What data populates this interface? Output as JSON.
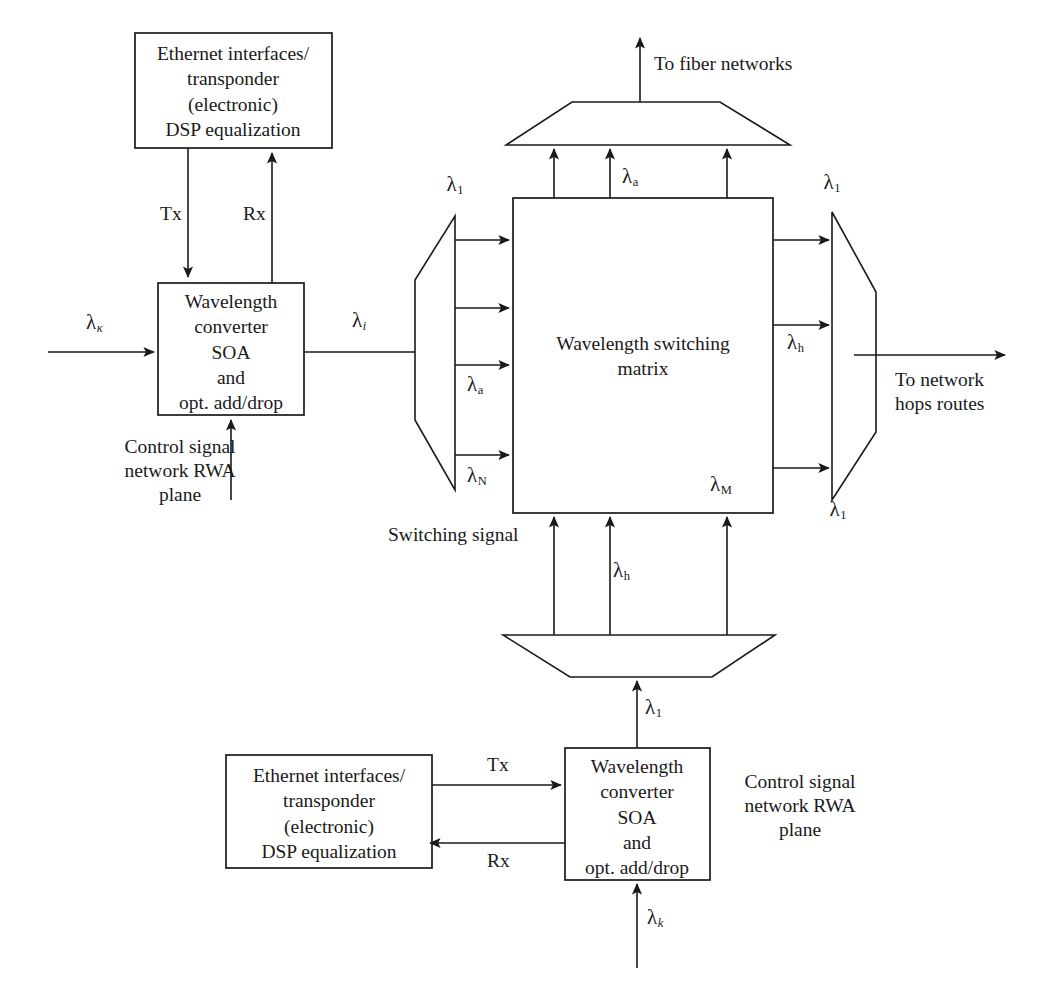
{
  "diagram": {
    "ink_color": "#1a1a1a",
    "background": "#ffffff"
  },
  "blocks": {
    "ethernet_top": {
      "lines": [
        "Ethernet interfaces/",
        "transponder",
        "(electronic)",
        "DSP equalization"
      ]
    },
    "converter_top": {
      "lines": [
        "Wavelength",
        "converter",
        "SOA",
        "and",
        "opt. add/drop"
      ]
    },
    "ethernet_bottom": {
      "lines": [
        "Ethernet interfaces/",
        "transponder",
        "(electronic)",
        "DSP equalization"
      ]
    },
    "converter_bottom": {
      "lines": [
        "Wavelength",
        "converter",
        "SOA",
        "and",
        "opt. add/drop"
      ]
    },
    "matrix": {
      "lines": [
        "Wavelength switching",
        "matrix"
      ]
    }
  },
  "labels": {
    "tx_top": "Tx",
    "rx_top": "Rx",
    "tx_bottom": "Tx",
    "rx_bottom": "Rx",
    "control_left": [
      "Control signal",
      "network RWA",
      "plane"
    ],
    "control_right": [
      "Control signal",
      "network RWA",
      "plane"
    ],
    "to_fiber_networks": "To fiber networks",
    "to_network_hops": [
      "To network",
      "hops routes"
    ],
    "switching_signal": "Switching signal"
  },
  "wavelengths": {
    "input_left": {
      "glyph": "λ",
      "sub": "κ",
      "italic": true
    },
    "converter_out": {
      "glyph": "λ",
      "sub": "i",
      "italic": true
    },
    "demux_top": {
      "glyph": "λ",
      "sub": "1",
      "italic": false
    },
    "demux_mid": {
      "glyph": "λ",
      "sub": "a",
      "italic": false
    },
    "demux_bottom": {
      "glyph": "λ",
      "sub": "N",
      "italic": false
    },
    "matrix_up_mid": {
      "glyph": "λ",
      "sub": "a",
      "italic": false
    },
    "matrix_corner": {
      "glyph": "λ",
      "sub": "M",
      "italic": false
    },
    "mux_top": {
      "glyph": "λ",
      "sub": "1",
      "italic": false
    },
    "mux_mid": {
      "glyph": "λ",
      "sub": "h",
      "italic": false
    },
    "mux_bottom": {
      "glyph": "λ",
      "sub": "1",
      "italic": false
    },
    "switching_mid": {
      "glyph": "λ",
      "sub": "h",
      "italic": false
    },
    "bottom_feed": {
      "glyph": "λ",
      "sub": "1",
      "italic": false
    },
    "input_bottom": {
      "glyph": "λ",
      "sub": "k",
      "italic": true
    }
  }
}
